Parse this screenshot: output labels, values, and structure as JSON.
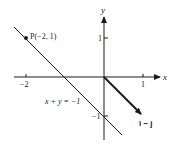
{
  "figure": {
    "axes": {
      "x_label": "x",
      "y_label": "y",
      "x_ticks": [
        {
          "value": -2,
          "label": "−2"
        },
        {
          "value": 1,
          "label": "1"
        }
      ],
      "y_ticks": [
        {
          "value": 1,
          "label": "1"
        },
        {
          "value": -1,
          "label": "−1"
        }
      ]
    },
    "point": {
      "label": "P(−2, 1)",
      "x": -2,
      "y": 1
    },
    "line": {
      "equation": "x + y = −1"
    },
    "vector": {
      "label": "i − j",
      "from": [
        0,
        0
      ],
      "to": [
        1,
        -1
      ]
    },
    "colors": {
      "ink": "#1a1a1a",
      "background": "#ffffff"
    }
  }
}
